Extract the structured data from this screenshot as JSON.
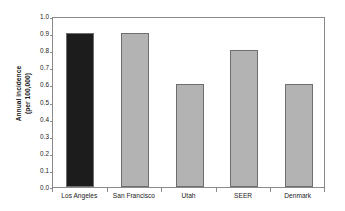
{
  "chart_data": {
    "type": "bar",
    "title": "",
    "xlabel": "",
    "ylabel": "Annual incidence\n(per 100,000)",
    "ylabel_lines": [
      "Annual incidence",
      "(per 100,000)"
    ],
    "categories": [
      "Los Angeles",
      "San Francisco",
      "Utah",
      "SEER",
      "Denmark"
    ],
    "values": [
      0.9,
      0.9,
      0.6,
      0.8,
      0.6
    ],
    "bar_colors": [
      "#1c1c1c",
      "#b3b3b3",
      "#b3b3b3",
      "#b3b3b3",
      "#b3b3b3"
    ],
    "bar_edge_color": "#6e6e6e",
    "ylim": [
      0.0,
      1.0
    ],
    "ytick_values": [
      0.0,
      0.1,
      0.2,
      0.3,
      0.4,
      0.5,
      0.6,
      0.7,
      0.8,
      0.9,
      1.0
    ],
    "ytick_labels": [
      "0.0",
      "0.1",
      "0.2",
      "0.3",
      "0.4",
      "0.5",
      "0.6",
      "0.7",
      "0.8",
      "0.9",
      "1.0"
    ],
    "grid": false,
    "legend": null,
    "frame_color": "#8a8a8a",
    "background": "#ffffff"
  }
}
